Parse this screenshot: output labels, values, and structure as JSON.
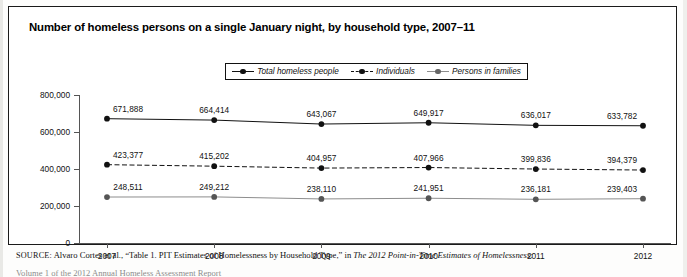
{
  "figure": {
    "title": "Number of homeless persons on a single January night, by household type, 2007–11"
  },
  "legend": {
    "items": [
      {
        "label": "Total homeless people",
        "style": "solid",
        "color": "#111111",
        "marker": "filled-circle"
      },
      {
        "label": "Individuals",
        "style": "dashed",
        "color": "#111111",
        "marker": "filled-circle"
      },
      {
        "label": "Persons in families",
        "style": "solid",
        "color": "#8d8d8d",
        "marker": "filled-circle"
      }
    ]
  },
  "source": {
    "label": "SOURCE:",
    "text_before_italic": " Alvaro Cortes et al., “Table 1. PIT Estimates of Homelessness by Household Type,” in ",
    "italic_text": "The 2012 Point-in-Time Estimates of Homelessness:",
    "line2": "Volume 1 of the 2012 Annual Homeless Assessment Report"
  },
  "chart_data": {
    "type": "line",
    "title": "Number of homeless persons on a single January night, by household type, 2007–11",
    "xlabel": "",
    "ylabel": "",
    "categories": [
      "2007",
      "2008",
      "2009",
      "2010",
      "2011",
      "2012"
    ],
    "ylim": [
      0,
      800000
    ],
    "yticks": [
      0,
      200000,
      400000,
      600000,
      800000
    ],
    "ytick_labels": [
      "0",
      "200,000",
      "400,000",
      "600,000",
      "800,000"
    ],
    "grid": false,
    "legend_position": "top-center",
    "series": [
      {
        "name": "Total homeless people",
        "values": [
          671888,
          664414,
          643067,
          649917,
          636017,
          633782
        ],
        "labels": [
          "671,888",
          "664,414",
          "643,067",
          "649,917",
          "636,017",
          "633,782"
        ]
      },
      {
        "name": "Individuals",
        "values": [
          423377,
          415202,
          404957,
          407966,
          399836,
          394379
        ],
        "labels": [
          "423,377",
          "415,202",
          "404,957",
          "407,966",
          "399,836",
          "394,379"
        ]
      },
      {
        "name": "Persons in families",
        "values": [
          248511,
          249212,
          238110,
          241951,
          236181,
          239403
        ],
        "labels": [
          "248,511",
          "249,212",
          "238,110",
          "241,951",
          "236,181",
          "239,403"
        ]
      }
    ]
  }
}
